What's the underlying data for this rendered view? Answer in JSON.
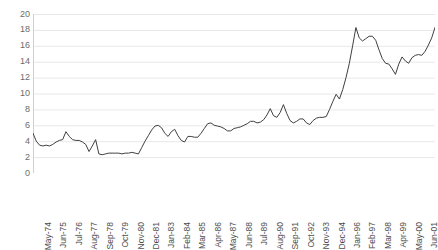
{
  "chart_data": {
    "type": "line",
    "title": "",
    "subtitle": "",
    "xlabel": "",
    "ylabel": "",
    "ylim": [
      0,
      20
    ],
    "y_ticks": [
      0,
      2,
      4,
      6,
      8,
      10,
      12,
      14,
      16,
      18,
      20
    ],
    "grid": "horizontal",
    "legend": "none",
    "line_color": "#404040",
    "grid_color": "#e8e8e8",
    "axis_color": "#d0d0d0",
    "background_color": "#ffffff",
    "x_tick_labels": [
      "May-74",
      "Jun-75",
      "Jul-76",
      "Aug-77",
      "Sep-78",
      "Oct-79",
      "Nov-80",
      "Dec-81",
      "Jan-83",
      "Feb-84",
      "Mar-85",
      "Apr-86",
      "May-87",
      "Jun-88",
      "Jul-89",
      "Aug-90",
      "Sep-91",
      "Oct-92",
      "Nov-93",
      "Dec-94",
      "Jan-96",
      "Feb-97",
      "Mar-98",
      "Apr-99",
      "May-00",
      "Jun-01"
    ],
    "x_tick_interval_months": 13,
    "series": [
      {
        "name": "",
        "values": [
          5.0,
          4.0,
          3.5,
          3.4,
          3.5,
          3.4,
          3.6,
          3.9,
          4.1,
          4.2,
          5.2,
          4.6,
          4.2,
          4.1,
          4.1,
          3.9,
          3.6,
          2.7,
          3.4,
          4.2,
          2.4,
          2.3,
          2.4,
          2.5,
          2.5,
          2.5,
          2.5,
          2.4,
          2.5,
          2.5,
          2.6,
          2.5,
          2.4,
          3.2,
          4.0,
          4.7,
          5.4,
          5.9,
          6.0,
          5.7,
          5.0,
          4.6,
          5.2,
          5.5,
          4.7,
          4.1,
          3.9,
          4.6,
          4.6,
          4.5,
          4.5,
          5.0,
          5.6,
          6.2,
          6.3,
          6.0,
          5.9,
          5.8,
          5.6,
          5.3,
          5.3,
          5.6,
          5.7,
          5.8,
          6.0,
          6.2,
          6.5,
          6.5,
          6.3,
          6.4,
          6.7,
          7.3,
          8.1,
          7.2,
          7.0,
          7.6,
          8.6,
          7.5,
          6.6,
          6.3,
          6.5,
          6.8,
          6.8,
          6.3,
          6.1,
          6.6,
          6.9,
          7.0,
          7.0,
          7.1,
          8.0,
          9.0,
          9.9,
          9.3,
          10.5,
          12.0,
          13.8,
          16.0,
          18.3,
          17.0,
          16.6,
          16.9,
          17.2,
          17.2,
          16.7,
          15.5,
          14.4,
          13.8,
          13.7,
          13.1,
          12.4,
          13.7,
          14.6,
          14.1,
          13.8,
          14.5,
          14.8,
          14.9,
          14.8,
          15.3,
          16.1,
          17.0,
          18.3
        ]
      }
    ]
  }
}
